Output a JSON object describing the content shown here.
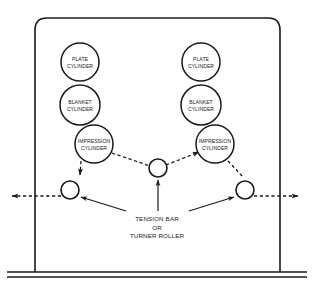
{
  "diagram": {
    "type": "schematic",
    "background_color": "#ffffff",
    "line_color": "#1a1a1a",
    "units": "px"
  },
  "frame": {
    "name": "press-frame",
    "left": 35,
    "right": 280,
    "top": 18,
    "bottom": 272,
    "corner_radius": 12,
    "base": {
      "line1_y": 272,
      "line2_y": 277,
      "x_start": 7,
      "x_end": 307
    }
  },
  "cylinders": [
    {
      "id": "plate-cylinder-left",
      "label_lines": [
        "PLATE",
        "CYLINDER"
      ],
      "cx": 80,
      "cy": 62,
      "r": 19,
      "side": "left"
    },
    {
      "id": "blanket-cylinder-left",
      "label_lines": [
        "BLANKET",
        "CYLINDER"
      ],
      "cx": 80,
      "cy": 105,
      "r": 20,
      "side": "left"
    },
    {
      "id": "impression-cylinder-left",
      "label_lines": [
        "IMPRESSION",
        "CYLINDER"
      ],
      "cx": 94,
      "cy": 144,
      "r": 19,
      "side": "left"
    },
    {
      "id": "plate-cylinder-right",
      "label_lines": [
        "PLATE",
        "CYLINDER"
      ],
      "cx": 201,
      "cy": 62,
      "r": 19,
      "side": "right"
    },
    {
      "id": "blanket-cylinder-right",
      "label_lines": [
        "BLANKET",
        "CYLINDER"
      ],
      "cx": 201,
      "cy": 105,
      "r": 20,
      "side": "right"
    },
    {
      "id": "impression-cylinder-right",
      "label_lines": [
        "IMPRESSION",
        "CYLINDER"
      ],
      "cx": 215,
      "cy": 144,
      "r": 19,
      "side": "right"
    }
  ],
  "rollers": [
    {
      "id": "turner-roller-left",
      "cx": 70,
      "cy": 190,
      "r": 9
    },
    {
      "id": "turner-roller-center",
      "cx": 158,
      "cy": 168,
      "r": 9
    },
    {
      "id": "turner-roller-right",
      "cx": 245,
      "cy": 190,
      "r": 9
    }
  ],
  "web_paths": [
    {
      "id": "web-left-down",
      "description": "dashed web from left impression cylinder down to left roller",
      "points": "82,162 80,176",
      "arrow_at": "end",
      "arrow_dir": "down"
    },
    {
      "id": "web-left-exit",
      "description": "dashed web exiting frame to the left",
      "points": "61,196 10,196",
      "arrow_at": "end",
      "arrow_dir": "left"
    },
    {
      "id": "web-center-left-diagonal",
      "description": "dashed web from left impression cylinder to center roller",
      "points": "112,152 150,165",
      "arrow_at": "none",
      "arrow_dir": "none"
    },
    {
      "id": "web-center-right-diagonal",
      "description": "dashed web from center roller up to right impression cylinder",
      "points": "167,164 198,152",
      "arrow_at": "end",
      "arrow_dir": "up-right"
    },
    {
      "id": "web-right-down",
      "description": "dashed web from right impression cylinder down to right roller",
      "points": "229,162 243,176",
      "arrow_at": "none",
      "arrow_dir": "none"
    },
    {
      "id": "web-right-exit",
      "description": "dashed web exiting frame to the right",
      "points": "254,196 300,196",
      "arrow_at": "end",
      "arrow_dir": "right"
    }
  ],
  "callout": {
    "id": "tension-bar-callout",
    "label_lines": [
      "TENSION BAR",
      "OR",
      "TURNER ROLLER"
    ],
    "text_center_x": 157,
    "text_top_y": 216,
    "line_height": 8.5,
    "leaders": [
      {
        "id": "leader-to-left-roller",
        "from": "124,211",
        "to": "80,196",
        "arrow": true
      },
      {
        "id": "leader-to-center-roller",
        "from": "158,211",
        "to": "158,180",
        "arrow": true
      },
      {
        "id": "leader-to-right-roller",
        "from": "190,211",
        "to": "235,196",
        "arrow": true
      }
    ]
  }
}
